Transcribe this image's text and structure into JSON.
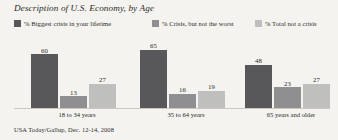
{
  "chart_data": {
    "type": "bar",
    "title": "Description of U.S. Economy, by Age",
    "subtitle": "",
    "xlabel": "",
    "ylabel": "",
    "ylim": [
      0,
      70
    ],
    "grid": false,
    "legend_position": "top",
    "source": "USA Today/Gallup, Dec. 12-14, 2008",
    "categories": [
      "18 to 34 years",
      "35 to 64 years",
      "65 years and older"
    ],
    "series": [
      {
        "name": "% Biggest crisis in your lifetime",
        "color": "#58585a",
        "values": [
          60,
          65,
          48
        ]
      },
      {
        "name": "% Crisis, but not the worst",
        "color": "#8f8f91",
        "values": [
          13,
          16,
          23
        ]
      },
      {
        "name": "% Total not a crisis",
        "color": "#bfbfbd",
        "values": [
          27,
          19,
          27
        ]
      }
    ]
  },
  "colors": {
    "background": "#f4f3ef",
    "text": "#2a2a28",
    "axis": "#c9c7bf",
    "series_dark": "#58585a",
    "series_mid": "#8f8f91",
    "series_light": "#bfbfbd"
  }
}
